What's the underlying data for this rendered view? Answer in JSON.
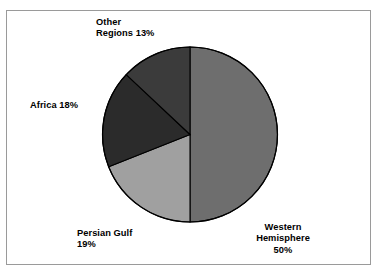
{
  "figure": {
    "frame_border_color": "#9a9a9a",
    "background_color": "#ffffff",
    "text_color": "#000000"
  },
  "chart_data": {
    "type": "pie",
    "title": "",
    "subtitle": "",
    "xlabel": "",
    "ylabel": "",
    "legend_position": "none",
    "grid": false,
    "labels_outside": true,
    "start_angle_deg": 0,
    "direction": "clockwise",
    "categories": [
      "Western Hemisphere",
      "Persian Gulf",
      "Africa",
      "Other Regions"
    ],
    "values": [
      50,
      19,
      18,
      13
    ],
    "value_suffix": "%",
    "colors": [
      "#6e6e6e",
      "#a0a0a0",
      "#2b2b2b",
      "#3b3b3b"
    ],
    "slice_outline_color": "#000000",
    "slices": [
      {
        "name": "Western Hemisphere",
        "value": 50,
        "color": "#6e6e6e",
        "label_lines": [
          "Western",
          "Hemisphere",
          "50%"
        ],
        "label_text": "Western\nHemisphere\n50%"
      },
      {
        "name": "Persian Gulf",
        "value": 19,
        "color": "#a0a0a0",
        "label_lines": [
          "Persian Gulf",
          "19%"
        ],
        "label_text": "Persian Gulf\n19%"
      },
      {
        "name": "Africa",
        "value": 18,
        "color": "#2b2b2b",
        "label_lines": [
          "Africa 18%"
        ],
        "label_text": "Africa 18%"
      },
      {
        "name": "Other Regions",
        "value": 13,
        "color": "#3b3b3b",
        "label_lines": [
          "Other",
          "Regions 13%"
        ],
        "label_text": "Other\nRegions 13%"
      }
    ]
  }
}
